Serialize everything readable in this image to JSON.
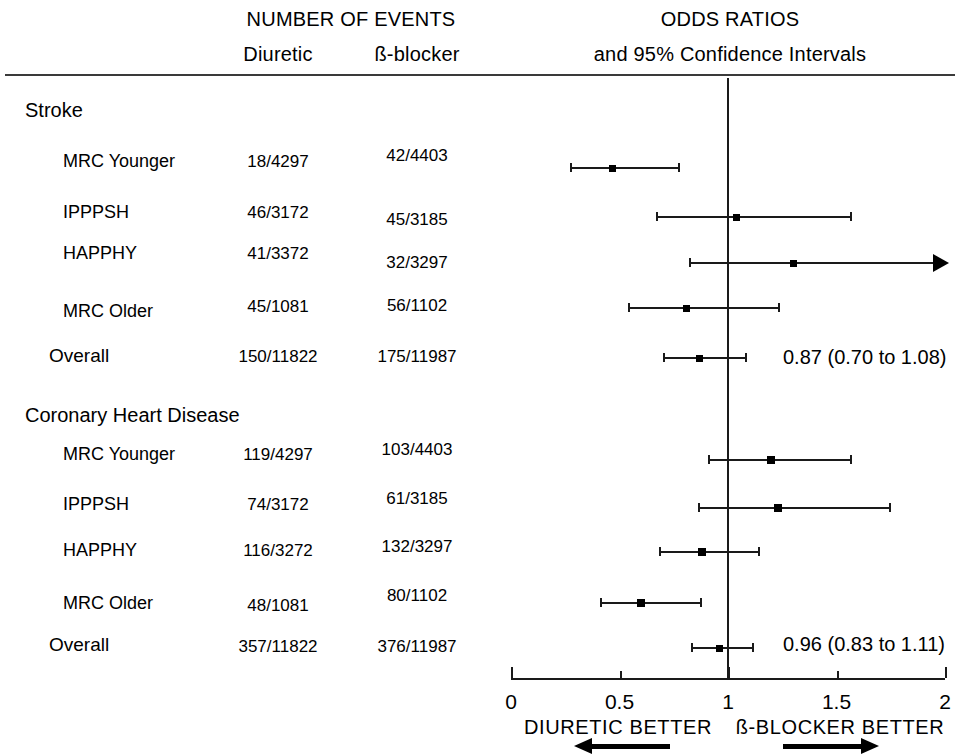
{
  "header": {
    "events_title": "NUMBER OF EVENTS",
    "col_diuretic": "Diuretic",
    "col_bblocker": "ß-blocker",
    "odds_title": "ODDS RATIOS",
    "odds_subtitle": "and 95% Confidence Intervals"
  },
  "footer": {
    "left_label": "DIURETIC BETTER",
    "right_label": "ß-BLOCKER BETTER"
  },
  "axis": {
    "ticks": [
      "0",
      "0.5",
      "1",
      "1.5",
      "2"
    ]
  },
  "groups": [
    {
      "heading": "Stroke",
      "rows": [
        {
          "label": "MRC Younger",
          "diuretic": "18/4297",
          "bblocker": "42/4403"
        },
        {
          "label": "IPPPSH",
          "diuretic": "46/3172",
          "bblocker": "45/3185"
        },
        {
          "label": "HAPPHY",
          "diuretic": "41/3372",
          "bblocker": "32/3297"
        },
        {
          "label": "MRC Older",
          "diuretic": "45/1081",
          "bblocker": "56/1102"
        },
        {
          "label": "Overall",
          "diuretic": "150/11822",
          "bblocker": "175/11987",
          "summary": "0.87 (0.70 to 1.08)"
        }
      ]
    },
    {
      "heading": "Coronary Heart Disease",
      "rows": [
        {
          "label": "MRC Younger",
          "diuretic": "119/4297",
          "bblocker": "103/4403"
        },
        {
          "label": "IPPPSH",
          "diuretic": "74/3172",
          "bblocker": "61/3185"
        },
        {
          "label": "HAPPHY",
          "diuretic": "116/3272",
          "bblocker": "132/3297"
        },
        {
          "label": "MRC Older",
          "diuretic": "48/1081",
          "bblocker": "80/1102"
        },
        {
          "label": "Overall",
          "diuretic": "357/11822",
          "bblocker": "376/11987",
          "summary": "0.96 (0.83 to 1.11)"
        }
      ]
    }
  ],
  "chart_data": {
    "type": "forest",
    "xlabel": "Odds ratio",
    "xlim": [
      0,
      2
    ],
    "xticks": [
      0,
      0.5,
      1,
      1.5,
      2
    ],
    "reference_line": 1.0,
    "grid": false,
    "left_annotation": "DIURETIC BETTER",
    "right_annotation": "ß-BLOCKER BETTER",
    "groups": [
      {
        "name": "Stroke",
        "points": [
          {
            "study": "MRC Younger",
            "or": 0.47,
            "ci_low": 0.27,
            "ci_high": 0.77,
            "events_diuretic": "18/4297",
            "events_bblocker": "42/4403",
            "summary": false,
            "clipped_high": false
          },
          {
            "study": "IPPPSH",
            "or": 1.04,
            "ci_low": 0.67,
            "ci_high": 1.56,
            "events_diuretic": "46/3172",
            "events_bblocker": "45/3185",
            "summary": false,
            "clipped_high": false
          },
          {
            "study": "HAPPHY",
            "or": 1.3,
            "ci_low": 0.82,
            "ci_high": 2.1,
            "events_diuretic": "41/3372",
            "events_bblocker": "32/3297",
            "summary": false,
            "clipped_high": true
          },
          {
            "study": "MRC Older",
            "or": 0.81,
            "ci_low": 0.54,
            "ci_high": 1.23,
            "events_diuretic": "45/1081",
            "events_bblocker": "56/1102",
            "summary": false,
            "clipped_high": false
          },
          {
            "study": "Overall",
            "or": 0.87,
            "ci_low": 0.7,
            "ci_high": 1.08,
            "events_diuretic": "150/11822",
            "events_bblocker": "175/11987",
            "summary": true,
            "clipped_high": false,
            "label": "0.87 (0.70 to 1.08)"
          }
        ]
      },
      {
        "name": "Coronary Heart Disease",
        "points": [
          {
            "study": "MRC Younger",
            "or": 1.2,
            "ci_low": 0.91,
            "ci_high": 1.56,
            "events_diuretic": "119/4297",
            "events_bblocker": "103/4403",
            "summary": false,
            "clipped_high": false
          },
          {
            "study": "IPPPSH",
            "or": 1.23,
            "ci_low": 0.86,
            "ci_high": 1.74,
            "events_diuretic": "74/3172",
            "events_bblocker": "61/3185",
            "summary": false,
            "clipped_high": false
          },
          {
            "study": "HAPPHY",
            "or": 0.88,
            "ci_low": 0.68,
            "ci_high": 1.14,
            "events_diuretic": "116/3272",
            "events_bblocker": "132/3297",
            "summary": false,
            "clipped_high": false
          },
          {
            "study": "MRC Older",
            "or": 0.6,
            "ci_low": 0.41,
            "ci_high": 0.87,
            "events_diuretic": "48/1081",
            "events_bblocker": "80/1102",
            "summary": false,
            "clipped_high": false
          },
          {
            "study": "Overall",
            "or": 0.96,
            "ci_low": 0.83,
            "ci_high": 1.11,
            "events_diuretic": "357/11822",
            "events_bblocker": "376/11987",
            "summary": true,
            "clipped_high": false,
            "label": "0.96 (0.83 to 1.11)"
          }
        ]
      }
    ]
  }
}
